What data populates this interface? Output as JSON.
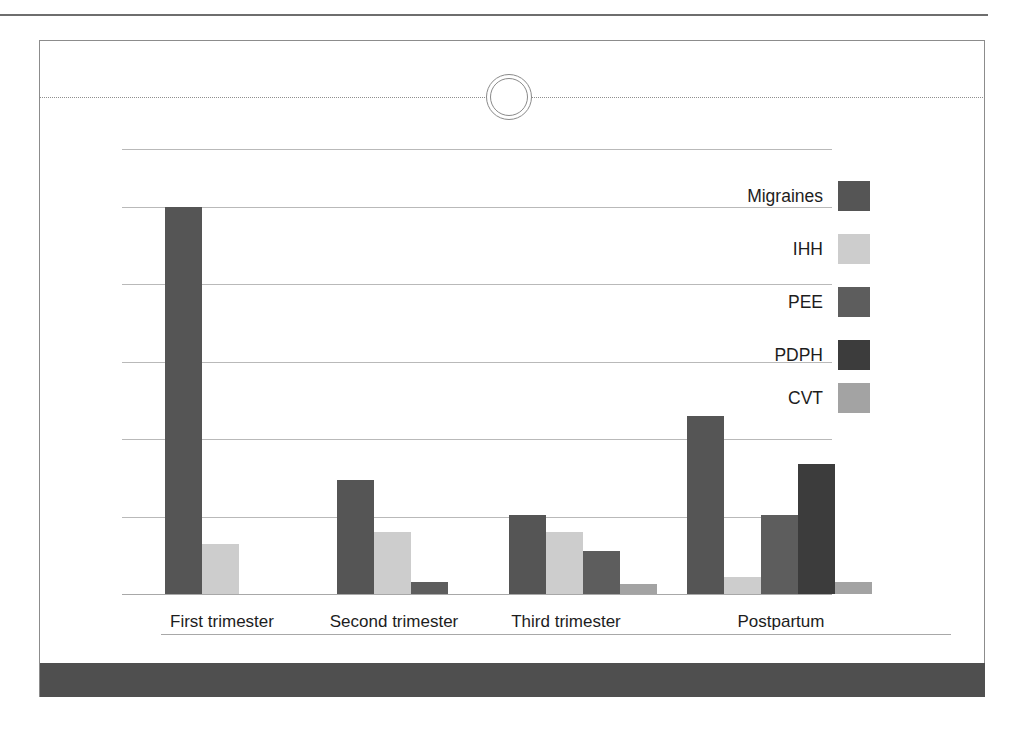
{
  "figure": {
    "caption": "",
    "categories_axis_label": "",
    "value_axis_label": ""
  },
  "chart_data": {
    "type": "bar",
    "title": "",
    "subtitle": "",
    "xlabel": "",
    "ylabel": "",
    "grid": true,
    "legend_position": "right-inside",
    "ylim": [
      0,
      100
    ],
    "y_gridline_values": [
      0,
      20,
      40,
      60,
      80,
      100,
      115
    ],
    "categories": [
      "First trimester",
      "Second trimester",
      "Third trimester",
      "Postpartum"
    ],
    "series": [
      {
        "name": "Migraines",
        "color": "#555555",
        "values": [
          100,
          29.5,
          20.5,
          46
        ]
      },
      {
        "name": "IHH",
        "color": "#cdcdcd",
        "values": [
          13,
          16,
          16,
          4.5
        ]
      },
      {
        "name": "PEE",
        "color": "#5d5d5d",
        "values": [
          0,
          3,
          11,
          20.5
        ]
      },
      {
        "name": "PDPH",
        "color": "#3c3c3c",
        "values": [
          0,
          0,
          0,
          33.5
        ]
      },
      {
        "name": "CVT",
        "color": "#a3a3a3",
        "values": [
          0,
          0,
          2.5,
          3
        ]
      }
    ]
  },
  "legend": {
    "items": [
      {
        "label": "Migraines",
        "color": "#555555"
      },
      {
        "label": "IHH",
        "color": "#cdcdcd"
      },
      {
        "label": "PEE",
        "color": "#5d5d5d"
      },
      {
        "label": "PDPH",
        "color": "#3c3c3c"
      },
      {
        "label": "CVT",
        "color": "#a3a3a3"
      }
    ]
  },
  "x_axis": {
    "tick_labels": [
      "First trimester",
      "Second trimester",
      "Third trimester",
      "Postpartum"
    ]
  },
  "colors": {
    "frame_border": "#8c8c8c",
    "gridline": "#b9b9b9",
    "page_rule": "#6e6e6e",
    "footer_band": "#4f4f4f",
    "perforation": "#8f8f8f",
    "text": "#1d1d1d"
  }
}
